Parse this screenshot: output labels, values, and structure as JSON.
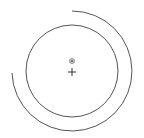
{
  "diagram": {
    "width": 144,
    "height": 138,
    "background": "#ffffff",
    "stroke_color": "#555555",
    "center": {
      "x": 72,
      "y": 72
    },
    "inner_circle": {
      "cx": 72,
      "cy": 71,
      "r": 46
    },
    "outer_arc": {
      "cx": 72,
      "cy": 71,
      "r": 60,
      "start": {
        "x": 72,
        "y": 11
      },
      "end": {
        "x": 12,
        "y": 73
      },
      "sweep": "clockwise"
    },
    "marker_dot": {
      "cx": 72,
      "cy": 61,
      "r": 2.5,
      "color": "#888888"
    },
    "cross": {
      "cx": 72,
      "cy": 72,
      "size": 4
    }
  }
}
